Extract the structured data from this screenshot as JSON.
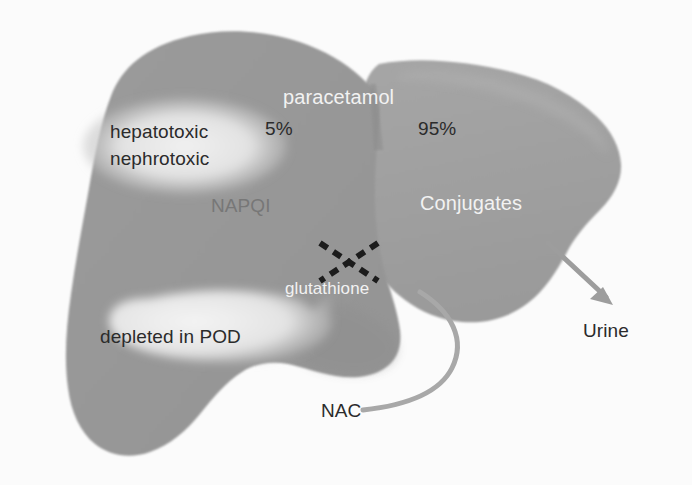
{
  "figure": {
    "background_color": "#fbfbfb",
    "width": 692,
    "height": 485
  },
  "diagram": {
    "type": "flow-diagram",
    "colors": {
      "liver_left_lobe": "#9a9a9a",
      "liver_right_lobe": "#a2a2a2",
      "liver_shadow": "#8b8b8b",
      "callout_light": "#e9e9e9",
      "arrow_gray": "#9d9d9d",
      "nac_line": "#a6a6a6",
      "text_white": "#f2f2f2",
      "text_dark": "#2b2b2b",
      "text_mid_gray": "#777777",
      "cross_black": "#1c1c1c"
    },
    "labels": {
      "paracetamol": "paracetamol",
      "percent_minor": "5%",
      "percent_major": "95%",
      "hepatotoxic": "hepatotoxic",
      "nephrotoxic": "nephrotoxic",
      "napqi": "NAPQI",
      "conjugates": "Conjugates",
      "glutathione": "glutathione",
      "depleted_in_pod": "depleted in POD",
      "urine": "Urine",
      "nac": "NAC"
    },
    "pathways": [
      {
        "name": "minor-oxidative-pathway",
        "fraction_label": "5%",
        "product": "NAPQI",
        "effect": "hepatotoxic nephrotoxic"
      },
      {
        "name": "major-conjugation-pathway",
        "fraction_label": "95%",
        "product": "Conjugates",
        "excretion": "Urine"
      }
    ],
    "annotations": [
      {
        "name": "blocked-reaction-cross",
        "glyph": "X",
        "style": "dashed",
        "meaning": "glutathione conjugation of NAPQI blocked"
      },
      {
        "name": "nac-supply-line",
        "from": "NAC",
        "to": "glutathione"
      },
      {
        "name": "depleted-callout",
        "text": "depleted in POD",
        "points_to": "glutathione"
      }
    ]
  }
}
